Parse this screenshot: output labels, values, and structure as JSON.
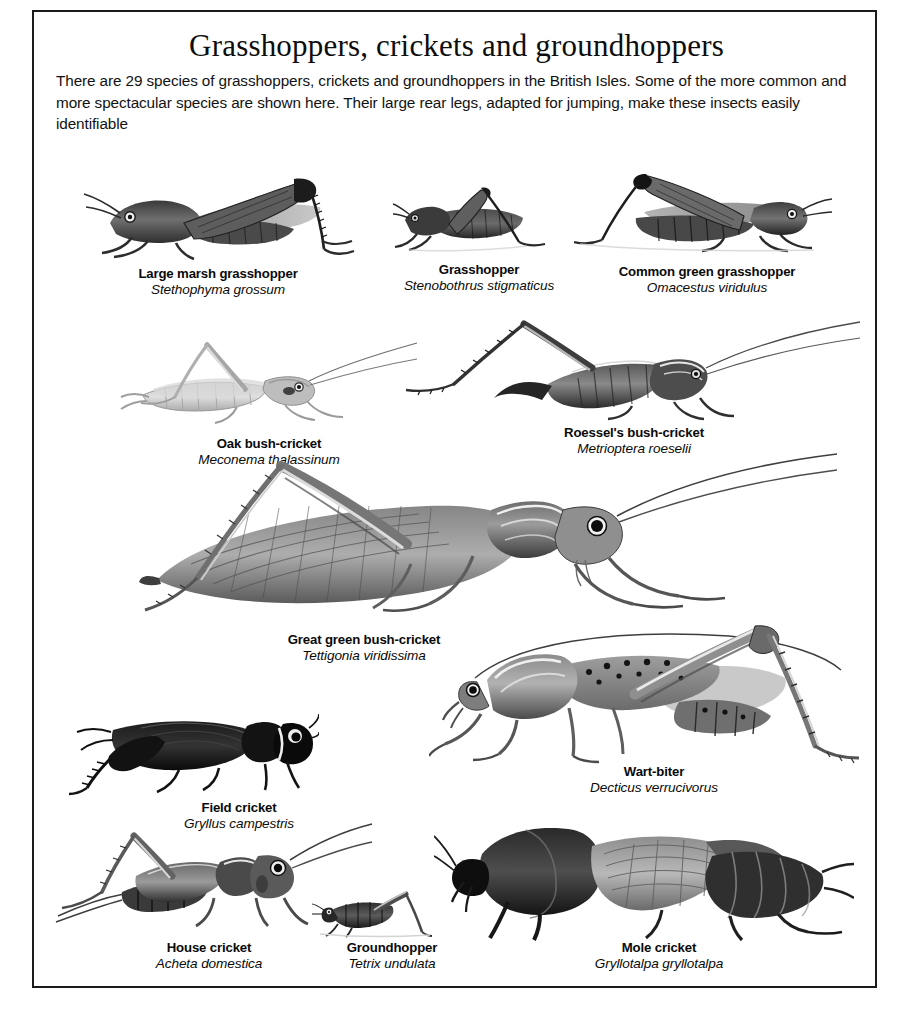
{
  "page": {
    "title": "Grasshoppers, crickets and groundhoppers",
    "intro": "There are 29 species of grasshoppers, crickets and groundhoppers in the British Isles. Some of the more common and more spectacular species are shown here. Their large rear legs, adapted for jumping, make these insects easily identifiable",
    "frame_color": "#1b1b1b",
    "background_color": "#ffffff",
    "text_color": "#0a0a0a",
    "species_count": 29,
    "region": "British Isles"
  },
  "species": [
    {
      "id": "large-marsh-grasshopper",
      "common": "Large marsh grasshopper",
      "latin": "Stethophyma grossum",
      "tone": "mid-dark",
      "facing": "left"
    },
    {
      "id": "grasshopper",
      "common": "Grasshopper",
      "latin": "Stenobothrus stigmaticus",
      "tone": "dark",
      "facing": "left"
    },
    {
      "id": "common-green-grasshopper",
      "common": "Common green grasshopper",
      "latin": "Omacestus viridulus",
      "tone": "mid-dark",
      "facing": "right"
    },
    {
      "id": "oak-bush-cricket",
      "common": "Oak bush-cricket",
      "latin": "Meconema thalassinum",
      "tone": "pale",
      "facing": "right"
    },
    {
      "id": "roessels-bush-cricket",
      "common": "Roessel's bush-cricket",
      "latin": "Metrioptera roeselii",
      "tone": "mid-dark",
      "facing": "right"
    },
    {
      "id": "great-green-bush-cricket",
      "common": "Great green bush-cricket",
      "latin": "Tettigonia viridissima",
      "tone": "mid",
      "facing": "right"
    },
    {
      "id": "wart-biter",
      "common": "Wart-biter",
      "latin": "Decticus verrucivorus",
      "tone": "mid",
      "facing": "left"
    },
    {
      "id": "field-cricket",
      "common": "Field cricket",
      "latin": "Gryllus campestris",
      "tone": "black",
      "facing": "right"
    },
    {
      "id": "house-cricket",
      "common": "House cricket",
      "latin": "Acheta domestica",
      "tone": "mid",
      "facing": "right"
    },
    {
      "id": "groundhopper",
      "common": "Groundhopper",
      "latin": "Tetrix undulata",
      "tone": "dark",
      "facing": "left"
    },
    {
      "id": "mole-cricket",
      "common": "Mole cricket",
      "latin": "Gryllotalpa gryllotalpa",
      "tone": "dark",
      "facing": "left"
    }
  ]
}
